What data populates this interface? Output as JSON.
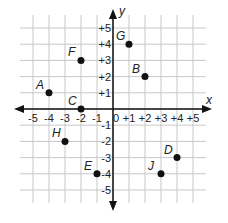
{
  "axes": {
    "x_label": "x",
    "y_label": "y"
  },
  "x_ticks": [
    "-5",
    "-4",
    "-3",
    "-2",
    "-1",
    "0",
    "+1",
    "+2",
    "+3",
    "+4",
    "+5"
  ],
  "y_ticks": [
    "+5",
    "+4",
    "+3",
    "+2",
    "+1",
    "-1",
    "-2",
    "-3",
    "-4",
    "-5"
  ],
  "points": [
    {
      "label": "A",
      "x": -4,
      "y": 1
    },
    {
      "label": "B",
      "x": 2,
      "y": 2
    },
    {
      "label": "C",
      "x": -2,
      "y": 0
    },
    {
      "label": "D",
      "x": 4,
      "y": -3
    },
    {
      "label": "E",
      "x": -1,
      "y": -4
    },
    {
      "label": "F",
      "x": -2,
      "y": 3
    },
    {
      "label": "G",
      "x": 1,
      "y": 4
    },
    {
      "label": "H",
      "x": -3,
      "y": -2
    },
    {
      "label": "J",
      "x": 3,
      "y": -4
    }
  ],
  "colors": {
    "grid": "#c8c8c8",
    "axis": "#111111",
    "point": "#111111"
  }
}
